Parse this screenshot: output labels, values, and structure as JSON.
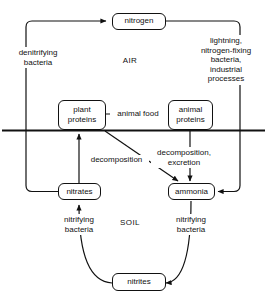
{
  "diagram": {
    "type": "cycle-flow-diagram",
    "line_color": "#111111",
    "background_color": "#ffffff",
    "regions": [
      {
        "id": "air",
        "label": "AIR"
      },
      {
        "id": "soil",
        "label": "SOIL"
      }
    ],
    "nodes": [
      {
        "id": "nitrogen",
        "label": "nitrogen",
        "region": "air"
      },
      {
        "id": "plant_proteins",
        "line1": "plant",
        "line2": "proteins",
        "region": "air"
      },
      {
        "id": "animal_proteins",
        "line1": "animal",
        "line2": "proteins",
        "region": "air"
      },
      {
        "id": "nitrates",
        "label": "nitrates",
        "region": "soil"
      },
      {
        "id": "ammonia",
        "label": "ammonia",
        "region": "soil"
      },
      {
        "id": "nitrites",
        "label": "nitrites",
        "region": "soil"
      }
    ],
    "edge_labels": {
      "denitrifying_bacteria": {
        "line1": "denitrifying",
        "line2": "bacteria"
      },
      "fixation": {
        "line1": "lightning,",
        "line2": "nitrogen-fixing",
        "line3": "bacteria,",
        "line4": "industrial",
        "line5": "processes"
      },
      "animal_food": {
        "label": "animal food"
      },
      "decomposition": {
        "label": "decomposition"
      },
      "decomposition_excretion": {
        "line1": "decomposition,",
        "line2": "excretion"
      },
      "nitrifying_bacteria_left": {
        "line1": "nitrifying",
        "line2": "bacteria"
      },
      "nitrifying_bacteria_right": {
        "line1": "nitrifying",
        "line2": "bacteria"
      }
    }
  }
}
